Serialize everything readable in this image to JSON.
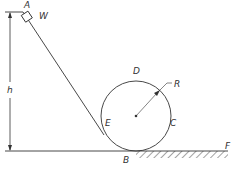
{
  "diagram": {
    "type": "mechanics-figure",
    "labels": {
      "A": "A",
      "W": "W",
      "h": "h",
      "D": "D",
      "R": "R",
      "E": "E",
      "C": "C",
      "B": "B",
      "F": "F"
    },
    "colors": {
      "line": "#333333",
      "background": "#ffffff"
    }
  }
}
